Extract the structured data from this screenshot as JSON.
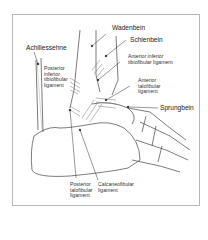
{
  "diagram": {
    "labels": {
      "wadenbein": "Wadenbein",
      "schienbein": "Schienbein",
      "achillessehne": "Achillessehne",
      "ant_inf_tibiofibular": "Anterior inferior\ntibiofibular ligament",
      "post_inf_tibiofibular": "Posterior\ninferior\ntibiofibular\nligament",
      "ant_talofibular": "Anterior\ntalofibular\nligament",
      "sprungbein": "Sprungbein",
      "post_talofibular": "Posterior\ntalofibular\nligament",
      "calcaneofibular": "Calcaneofibular\nligament"
    }
  }
}
